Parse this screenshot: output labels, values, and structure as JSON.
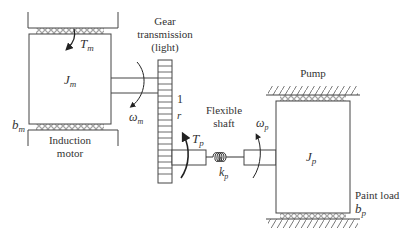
{
  "diagram": {
    "motor": {
      "title_line1": "Induction",
      "title_line2": "motor",
      "inertia": "J",
      "inertia_sub": "m",
      "torque": "T",
      "torque_sub": "m",
      "damping": "b",
      "damping_sub": "m",
      "speed": "ω",
      "speed_sub": "m"
    },
    "gear": {
      "title_line1": "Gear",
      "title_line2": "transmission",
      "title_line3": "(light)",
      "ratio_top": "1",
      "ratio_bottom": "r"
    },
    "shaft": {
      "title_line1": "Flexible",
      "title_line2": "shaft",
      "torque": "T",
      "torque_sub": "p",
      "stiffness": "k",
      "stiffness_sub": "p",
      "speed": "ω",
      "speed_sub": "p"
    },
    "pump": {
      "title": "Pump",
      "inertia": "J",
      "inertia_sub": "p",
      "load_label": "Paint load",
      "damping": "b",
      "damping_sub": "p"
    },
    "colors": {
      "stroke": "#444444",
      "text": "#333333",
      "background": "#ffffff"
    }
  }
}
